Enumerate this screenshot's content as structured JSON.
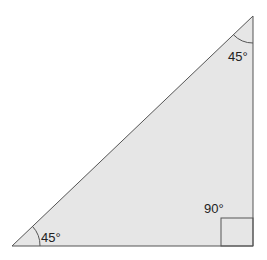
{
  "diagram": {
    "type": "right-isosceles-triangle",
    "fill": "#e6e6e6",
    "stroke": "#555555",
    "angles": {
      "top": "45°",
      "bottom_left": "45°",
      "right_angle": "90°"
    }
  }
}
